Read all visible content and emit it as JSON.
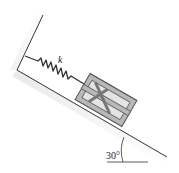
{
  "diagram": {
    "spring_label": "k",
    "angle_label": "30°",
    "incline_angle_deg": 30,
    "colors": {
      "line": "#333333",
      "crate_fill": "#b8b8b8",
      "crate_inner": "#e4e4e4",
      "crate_stroke": "#555555",
      "shadow": "#e8e8e8"
    }
  }
}
